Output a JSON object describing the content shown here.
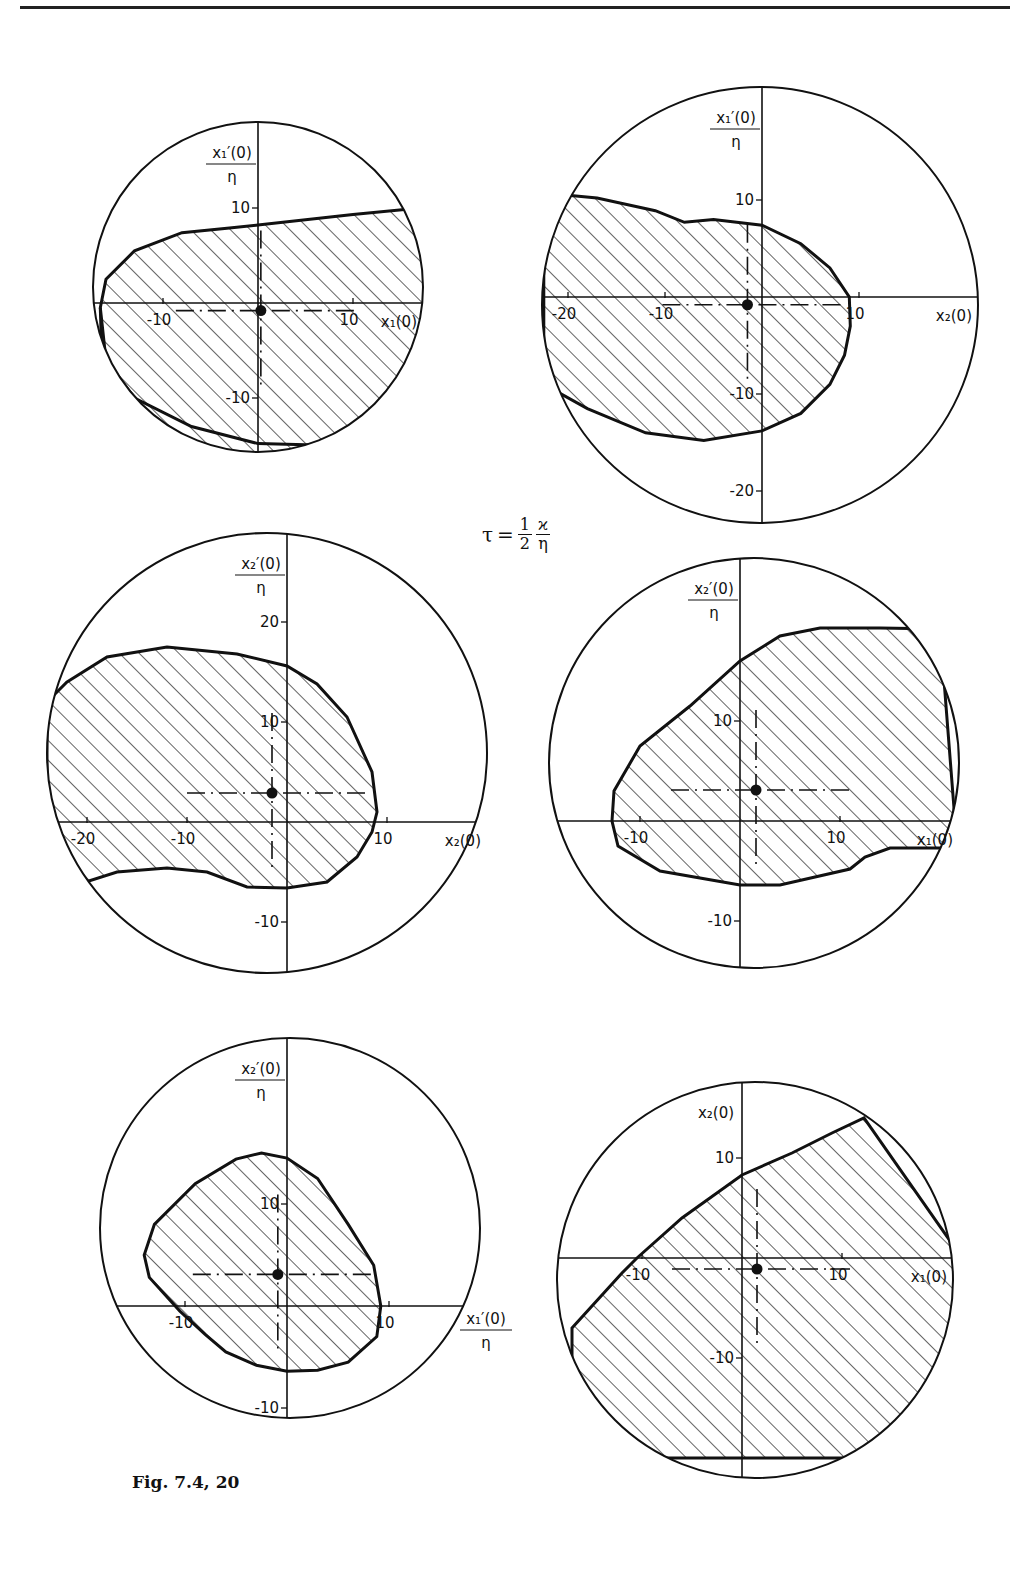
{
  "figure": {
    "caption": "Fig. 7.4, 20",
    "parameter": {
      "symbol": "τ",
      "equals": "=",
      "num": "1",
      "den": "2",
      "num2": "ϰ",
      "den2": "η"
    },
    "colors": {
      "ink": "#111111",
      "paper": "#ffffff"
    }
  },
  "panels": [
    {
      "id": "p1",
      "cx": 258,
      "cy": 287,
      "r": 165,
      "ox": 258,
      "oy": 303,
      "scale": 9.5,
      "x_label": "x₁(0)",
      "y_label_num": "x₁′(0)",
      "y_label_den": "η",
      "x_ticks": [
        -10,
        10
      ],
      "y_ticks": [
        10,
        -10
      ],
      "operating_point": [
        0.3,
        -0.8
      ],
      "boundary": [
        [
          -16.6,
          -0.5
        ],
        [
          -16,
          2.5
        ],
        [
          -13,
          5.5
        ],
        [
          -8,
          7.4
        ],
        [
          -3,
          7.9
        ],
        [
          0,
          8.2
        ],
        [
          10,
          9.3
        ],
        [
          20,
          10.3
        ],
        [
          30,
          10.5
        ],
        [
          30,
          -20
        ],
        [
          -16,
          -20
        ],
        [
          -16.6,
          -0.5
        ]
      ],
      "boundary_lower": [
        [
          -16.6,
          -0.5
        ],
        [
          -16,
          -6
        ],
        [
          -13,
          -10
        ],
        [
          -7,
          -13
        ],
        [
          0,
          -14.8
        ],
        [
          8,
          -15
        ],
        [
          14,
          -14
        ],
        [
          19,
          -12.5
        ]
      ]
    },
    {
      "id": "p2",
      "cx": 760,
      "cy": 305,
      "r": 218,
      "ox": 762,
      "oy": 297,
      "scale": 9.7,
      "x_label": "x₂(0)",
      "y_label_num": "x₁′(0)",
      "y_label_den": "η",
      "x_ticks": [
        -20,
        -10,
        10
      ],
      "y_ticks": [
        10,
        -10,
        -20
      ],
      "operating_point": [
        -1.5,
        -0.8
      ],
      "boundary": [
        [
          -20,
          10.5
        ],
        [
          -17,
          10.2
        ],
        [
          -11,
          8.9
        ],
        [
          -8,
          7.7
        ],
        [
          -5,
          8
        ],
        [
          0,
          7.4
        ],
        [
          4,
          5.5
        ],
        [
          7,
          3
        ],
        [
          9,
          0
        ],
        [
          9.1,
          -3
        ],
        [
          8.5,
          -6
        ],
        [
          7,
          -9
        ],
        [
          4,
          -12
        ],
        [
          0,
          -13.8
        ],
        [
          -6,
          -14.8
        ],
        [
          -12,
          -14
        ],
        [
          -18,
          -11.5
        ],
        [
          -22.5,
          -9
        ],
        [
          -22.5,
          10.5
        ]
      ]
    },
    {
      "id": "p3",
      "cx": 267,
      "cy": 753,
      "r": 220,
      "ox": 287,
      "oy": 822,
      "scale": 10,
      "x_label": "x₂(0)",
      "y_label_num": "x₂′(0)",
      "y_label_den": "η",
      "x_ticks": [
        -20,
        -10,
        10
      ],
      "y_ticks": [
        20,
        10,
        -10
      ],
      "operating_point": [
        -1.5,
        2.9
      ],
      "boundary": [
        [
          -22,
          14
        ],
        [
          -18,
          16.5
        ],
        [
          -12,
          17.5
        ],
        [
          -5,
          16.8
        ],
        [
          0,
          15.6
        ],
        [
          3,
          13.8
        ],
        [
          6,
          10.5
        ],
        [
          8.5,
          5
        ],
        [
          9,
          1
        ],
        [
          8.5,
          -1
        ],
        [
          7,
          -3.5
        ],
        [
          4,
          -6
        ],
        [
          0,
          -6.6
        ],
        [
          -4,
          -6.5
        ],
        [
          -8,
          -5
        ],
        [
          -12,
          -4.6
        ],
        [
          -17,
          -5
        ],
        [
          -22,
          -6.6
        ],
        [
          -24,
          -6
        ],
        [
          -24,
          12
        ]
      ]
    },
    {
      "id": "p4",
      "cx": 754,
      "cy": 763,
      "r": 205,
      "ox": 740,
      "oy": 821,
      "scale": 10,
      "x_label": "x₁(0)",
      "y_label_num": "x₂′(0)",
      "y_label_den": "η",
      "x_ticks": [
        -10,
        10
      ],
      "y_ticks": [
        10,
        -10
      ],
      "operating_point": [
        1.6,
        3.1
      ],
      "boundary": [
        [
          -12.8,
          0
        ],
        [
          -12.6,
          3
        ],
        [
          -10,
          7.5
        ],
        [
          -5,
          11.5
        ],
        [
          0,
          16
        ],
        [
          4,
          18.5
        ],
        [
          8,
          19.3
        ],
        [
          14,
          19.3
        ],
        [
          20,
          19.2
        ],
        [
          21.5,
          0
        ],
        [
          21.5,
          -2.7
        ],
        [
          15,
          -2.7
        ],
        [
          12.5,
          -3.6
        ],
        [
          11,
          -4.8
        ],
        [
          4,
          -6.4
        ],
        [
          0,
          -6.4
        ],
        [
          -8,
          -5
        ],
        [
          -12.2,
          -2.5
        ]
      ]
    },
    {
      "id": "p5",
      "cx": 290,
      "cy": 1228,
      "r": 190,
      "ox": 287,
      "oy": 1306,
      "scale": 10.2,
      "x_label_num": "x₁′(0)",
      "x_label_den": "η",
      "y_label_num": "x₂′(0)",
      "y_label_den": "η",
      "x_ticks": [
        -10,
        10
      ],
      "y_ticks": [
        10,
        -10
      ],
      "operating_point": [
        -0.9,
        3.1
      ],
      "boundary": [
        [
          -8,
          -2.8
        ],
        [
          -10.5,
          -0.5
        ],
        [
          -13.5,
          2.8
        ],
        [
          -14,
          5
        ],
        [
          -13,
          8
        ],
        [
          -9,
          12
        ],
        [
          -5,
          14.4
        ],
        [
          -2.5,
          15
        ],
        [
          0,
          14.5
        ],
        [
          3,
          12.5
        ],
        [
          6,
          8
        ],
        [
          8.5,
          4
        ],
        [
          9.2,
          0
        ],
        [
          8.8,
          -3
        ],
        [
          6,
          -5.5
        ],
        [
          3,
          -6.3
        ],
        [
          0,
          -6.4
        ],
        [
          -3,
          -5.8
        ],
        [
          -6,
          -4.5
        ],
        [
          -8,
          -2.8
        ]
      ]
    },
    {
      "id": "p6",
      "cx": 755,
      "cy": 1280,
      "r": 198,
      "ox": 742,
      "oy": 1258,
      "scale": 10,
      "x_label": "x₁(0)",
      "y_label_num": "x₂(0)",
      "y_label_den": "",
      "x_ticks": [
        -10,
        10
      ],
      "y_ticks": [
        10,
        -10
      ],
      "operating_point": [
        1.5,
        -1.1
      ],
      "boundary": [
        [
          -17,
          -7
        ],
        [
          -12,
          -1.5
        ],
        [
          -10.5,
          0
        ],
        [
          -6,
          4
        ],
        [
          0,
          8.3
        ],
        [
          5,
          10.5
        ],
        [
          9,
          12.5
        ],
        [
          12.2,
          14
        ],
        [
          22,
          0
        ],
        [
          22,
          -20
        ],
        [
          -17,
          -20
        ]
      ]
    }
  ]
}
